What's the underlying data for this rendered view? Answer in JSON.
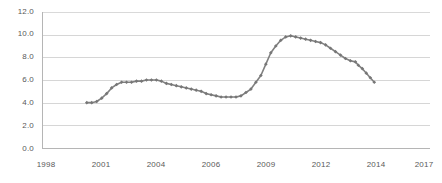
{
  "chart_data": {
    "type": "line",
    "title": "",
    "subtitle": "",
    "xlabel": "",
    "ylabel": "",
    "ylim": [
      0.0,
      12.0
    ],
    "y_ticks": [
      "0.0",
      "2.0",
      "4.0",
      "6.0",
      "8.0",
      "10.0",
      "12.0"
    ],
    "y_tick_values": [
      0.0,
      2.0,
      4.0,
      6.0,
      8.0,
      10.0,
      12.0
    ],
    "x_tick_labels": [
      "1998",
      "2001",
      "2004",
      "2006",
      "2009",
      "2012",
      "2014",
      "2017"
    ],
    "xlim": [
      1998.0,
      2017.5
    ],
    "grid": true,
    "legend": false,
    "legend_position": "none",
    "line_color": "#808080",
    "marker": "diamond",
    "marker_color": "#777777",
    "series": [
      {
        "name": "Unemployment rate",
        "x": [
          2000.25,
          2000.5,
          2000.75,
          2001.0,
          2001.25,
          2001.5,
          2001.75,
          2002.0,
          2002.25,
          2002.5,
          2002.75,
          2003.0,
          2003.25,
          2003.5,
          2003.75,
          2004.0,
          2004.25,
          2004.5,
          2004.75,
          2005.0,
          2005.25,
          2005.5,
          2005.75,
          2006.0,
          2006.25,
          2006.5,
          2006.75,
          2007.0,
          2007.25,
          2007.5,
          2007.75,
          2008.0,
          2008.25,
          2008.5,
          2008.75,
          2009.0,
          2009.25,
          2009.5,
          2009.75,
          2010.0,
          2010.25,
          2010.5,
          2010.75,
          2011.0,
          2011.25,
          2011.5,
          2011.75,
          2012.0,
          2012.25,
          2012.5,
          2012.75,
          2013.0,
          2013.25,
          2013.5,
          2013.75
        ],
        "values": [
          4.0,
          4.0,
          4.1,
          4.4,
          4.8,
          5.3,
          5.6,
          5.8,
          5.8,
          5.8,
          5.9,
          5.9,
          6.0,
          6.0,
          6.0,
          5.9,
          5.7,
          5.6,
          5.5,
          5.4,
          5.3,
          5.2,
          5.1,
          5.0,
          4.8,
          4.7,
          4.6,
          4.5,
          4.5,
          4.5,
          4.5,
          4.6,
          4.9,
          5.2,
          5.8,
          6.4,
          7.4,
          8.4,
          9.0,
          9.5,
          9.8,
          9.9,
          9.8,
          9.7,
          9.6,
          9.5,
          9.4,
          9.3,
          9.1,
          8.8,
          8.5,
          8.2,
          7.9,
          7.7,
          7.6
        ]
      },
      {
        "name": "Unemployment rate (tail)",
        "x": [
          2013.9,
          2014.1,
          2014.3,
          2014.5,
          2014.7
        ],
        "values": [
          7.3,
          7.0,
          6.6,
          6.2,
          5.8
        ]
      }
    ]
  }
}
